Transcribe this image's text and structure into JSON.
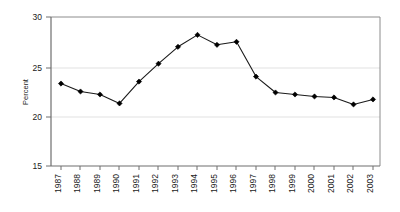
{
  "chart_data": {
    "type": "line",
    "title": "",
    "subtitle": "",
    "xlabel": "",
    "ylabel": "Percent",
    "categories": [
      "1987",
      "1988",
      "1989",
      "1990",
      "1991",
      "1992",
      "1993",
      "1994",
      "1995",
      "1996",
      "1997",
      "1998",
      "1999",
      "2000",
      "2001",
      "2002",
      "2003"
    ],
    "values": [
      23.3,
      22.5,
      22.2,
      21.3,
      23.5,
      25.3,
      27.0,
      28.2,
      27.2,
      27.5,
      24.0,
      22.4,
      22.2,
      22.0,
      21.9,
      21.2,
      21.7
    ],
    "series": [
      {
        "name": "Percent",
        "values": [
          23.3,
          22.5,
          22.2,
          21.3,
          23.5,
          25.3,
          27.0,
          28.2,
          27.2,
          27.5,
          24.0,
          22.4,
          22.2,
          22.0,
          21.9,
          21.2,
          21.7
        ]
      }
    ],
    "ylim": [
      15,
      30
    ],
    "ytick_labels": [
      "15",
      "20",
      "25",
      "30"
    ],
    "yticks": [
      15,
      20,
      25,
      30
    ],
    "grid": true,
    "gridlines_at": [
      20,
      25
    ],
    "legend": "none",
    "marker": "diamond",
    "line_color": "#1a1a1a",
    "marker_color": "#000000",
    "grid_color": "#e8e8e8",
    "axis_color": "#808080",
    "background_color": "#ffffff",
    "x_tick_label_rotation": -90
  },
  "axes": {
    "y_axis_title": "Percent",
    "y_tick_0": "15",
    "y_tick_1": "20",
    "y_tick_2": "25",
    "y_tick_3": "30"
  },
  "x_labels": {
    "l0": "1987",
    "l1": "1988",
    "l2": "1989",
    "l3": "1990",
    "l4": "1991",
    "l5": "1992",
    "l6": "1993",
    "l7": "1994",
    "l8": "1995",
    "l9": "1996",
    "l10": "1997",
    "l11": "1998",
    "l12": "1999",
    "l13": "2000",
    "l14": "2001",
    "l15": "2002",
    "l16": "2003"
  }
}
